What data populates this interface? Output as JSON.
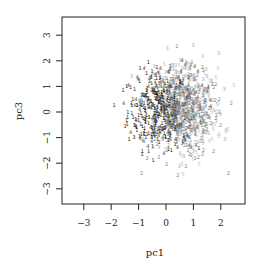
{
  "chart_data": {
    "type": "scatter",
    "title": "",
    "xlabel": "pc1",
    "ylabel": "pc3",
    "xlim": [
      -3.8,
      2.9
    ],
    "ylim": [
      -3.6,
      3.7
    ],
    "x_ticks": [
      -3,
      -2,
      -1,
      0,
      1,
      2
    ],
    "y_ticks": [
      -3,
      -2,
      -1,
      0,
      1,
      2,
      3
    ],
    "grid": false,
    "legend": null,
    "marker": "digit labels (class ids 1-5)",
    "classes": [
      {
        "label": "1",
        "color": "#1a1a1a",
        "center": [
          -0.3,
          0.0
        ],
        "sd": [
          0.55,
          0.75
        ],
        "n": 260
      },
      {
        "label": "2",
        "color": "#8a8a8a",
        "center": [
          0.7,
          -0.3
        ],
        "sd": [
          0.7,
          0.85
        ],
        "n": 200
      },
      {
        "label": "3",
        "color": "#a8a8a8",
        "center": [
          0.6,
          0.4
        ],
        "sd": [
          0.65,
          0.9
        ],
        "n": 200
      },
      {
        "label": "4",
        "color": "#4a4a4a",
        "center": [
          0.2,
          0.1
        ],
        "sd": [
          0.6,
          0.8
        ],
        "n": 220
      },
      {
        "label": "5",
        "color": "#bdbdbd",
        "center": [
          0.9,
          0.0
        ],
        "sd": [
          0.6,
          0.8
        ],
        "n": 160
      }
    ],
    "approx_cloud": {
      "x_center": 0.3,
      "y_center": 0.0,
      "x_range": [
        -2.2,
        2.5
      ],
      "y_range": [
        -3.1,
        3.4
      ]
    }
  },
  "axes": {
    "x_tick_labels": [
      "−3",
      "−2",
      "−1",
      "0",
      "1",
      "2"
    ],
    "y_tick_labels": [
      "−3",
      "−2",
      "−1",
      "0",
      "1",
      "2",
      "3"
    ]
  }
}
